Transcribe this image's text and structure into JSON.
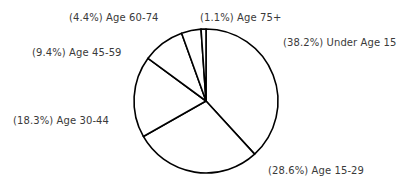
{
  "chart_data": {
    "type": "pie",
    "title": "",
    "start_angle_deg": 0,
    "direction": "clockwise",
    "categories": [
      "Under Age 15",
      "Age 15-29",
      "Age 30-44",
      "Age 45-59",
      "Age 60-74",
      "Age 75+"
    ],
    "values": [
      38.2,
      28.6,
      18.3,
      9.4,
      4.4,
      1.1
    ],
    "labels": [
      "(38.2%) Under Age 15",
      "(28.6%) Age 15-29",
      "(18.3%) Age 30-44",
      "(9.4%) Age 45-59",
      "(4.4%) Age 60-74",
      "(1.1%) Age 75+"
    ],
    "label_positions": [
      {
        "x": 283,
        "y": 37
      },
      {
        "x": 268,
        "y": 165
      },
      {
        "x": 13,
        "y": 115
      },
      {
        "x": 32,
        "y": 47
      },
      {
        "x": 69,
        "y": 12
      },
      {
        "x": 200,
        "y": 12
      }
    ],
    "fill": "#ffffff",
    "stroke": "#000000",
    "center": {
      "x": 206,
      "y": 101
    },
    "radius": 72,
    "legend": "none"
  }
}
